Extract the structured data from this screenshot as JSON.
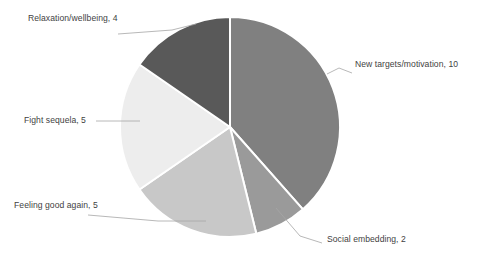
{
  "chart_data": {
    "type": "pie",
    "title": "",
    "total": 26,
    "start_angle_deg": 0,
    "direction": "clockwise",
    "legend_position": "none",
    "labels_outside": true,
    "label_format": "name, value",
    "categories": [
      "New targets/motivation",
      "Social embedding",
      "Feeling good again",
      "Fight sequela",
      "Relaxation/wellbeing"
    ],
    "values": [
      10,
      2,
      5,
      5,
      4
    ],
    "colors": [
      "#808080",
      "#9a9a9a",
      "#c8c8c8",
      "#ededed",
      "#595959"
    ],
    "slices": [
      {
        "name": "New targets/motivation",
        "value": 10,
        "color": "#808080",
        "label_text": "New targets/motivation, 10"
      },
      {
        "name": "Social embedding",
        "value": 2,
        "color": "#9a9a9a",
        "label_text": "Social embedding, 2"
      },
      {
        "name": "Feeling good again",
        "value": 5,
        "color": "#c8c8c8",
        "label_text": "Feeling good again, 5"
      },
      {
        "name": "Fight sequela",
        "value": 5,
        "color": "#ededed",
        "label_text": "Fight sequela, 5"
      },
      {
        "name": "Relaxation/wellbeing",
        "value": 4,
        "color": "#595959",
        "label_text": "Relaxation/wellbeing, 4"
      }
    ],
    "geometry": {
      "center_x": 230,
      "center_y": 127,
      "radius": 110
    },
    "style": {
      "background": "#ffffff",
      "slice_border": "#ffffff",
      "leader_line": "#a6a6a6",
      "label_text_color": "#3f3f3f"
    }
  }
}
